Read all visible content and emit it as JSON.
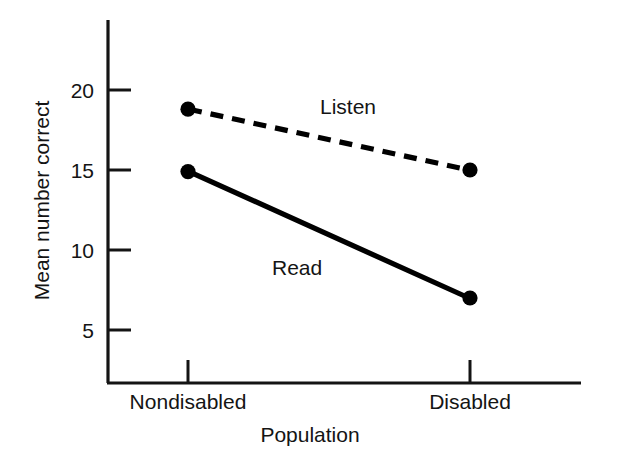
{
  "chart_data": {
    "type": "line",
    "title": "",
    "subtitle": "",
    "xlabel": "Population",
    "ylabel": "Mean number correct",
    "categories": [
      "Nondisabled",
      "Disabled"
    ],
    "series": [
      {
        "name": "Listen",
        "values": [
          18.8,
          15.0
        ],
        "linestyle": "dashed",
        "marker": "filled-circle",
        "color": "#000000"
      },
      {
        "name": "Read",
        "values": [
          14.9,
          7.0
        ],
        "linestyle": "solid",
        "marker": "filled-circle",
        "color": "#000000"
      }
    ],
    "ylim": [
      0,
      23.5
    ],
    "yticks": [
      5,
      10,
      15,
      20
    ],
    "ytick_labels": [
      "5",
      "10",
      "15",
      "20"
    ],
    "xtick_labels": [
      "Nondisabled",
      "Disabled"
    ],
    "grid": false,
    "legend": "inline-annotations",
    "annotations": [
      {
        "text": "Listen",
        "x": 0.47,
        "y": 19.0
      },
      {
        "text": "Read",
        "x": 0.29,
        "y": 10.3
      }
    ]
  },
  "axes": {
    "ytick_0_label": "5",
    "ytick_1_label": "10",
    "ytick_2_label": "15",
    "ytick_3_label": "20",
    "xtick_0_label": "Nondisabled",
    "xtick_1_label": "Disabled",
    "x_axis_title": "Population",
    "y_axis_title": "Mean number correct"
  },
  "labels": {
    "listen": "Listen",
    "read": "Read"
  },
  "colors": {
    "ink": "#000000",
    "background": "#ffffff"
  }
}
